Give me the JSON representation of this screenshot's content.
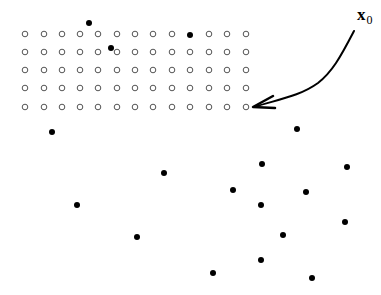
{
  "diagram": {
    "width": 381,
    "height": 295,
    "colors": {
      "background": "#ffffff",
      "ink": "#000000",
      "open_circle_stroke": "#555555"
    },
    "grid": {
      "rows": 5,
      "cols": 13,
      "col_x": [
        25,
        44,
        62,
        80,
        98,
        117,
        135,
        153,
        172,
        190,
        209,
        227,
        246
      ],
      "row_y": [
        34,
        52,
        70,
        88,
        107
      ],
      "open_radius": 2.8,
      "replaced_cells": [
        [
          0,
          9
        ]
      ]
    },
    "filled_points": [
      {
        "x": 89,
        "y": 23
      },
      {
        "x": 111,
        "y": 48
      },
      {
        "x": 190,
        "y": 35
      },
      {
        "x": 52,
        "y": 132
      },
      {
        "x": 297,
        "y": 129
      },
      {
        "x": 164,
        "y": 173
      },
      {
        "x": 262,
        "y": 164
      },
      {
        "x": 347,
        "y": 167
      },
      {
        "x": 233,
        "y": 190
      },
      {
        "x": 306,
        "y": 192
      },
      {
        "x": 77,
        "y": 205
      },
      {
        "x": 261,
        "y": 205
      },
      {
        "x": 345,
        "y": 222
      },
      {
        "x": 137,
        "y": 237
      },
      {
        "x": 283,
        "y": 235
      },
      {
        "x": 261,
        "y": 260
      },
      {
        "x": 213,
        "y": 273
      },
      {
        "x": 312,
        "y": 278
      }
    ],
    "filled_radius": 3,
    "arrow": {
      "path": "M 354 31 C 340 58, 332 72, 318 83 C 300 96, 280 99, 254 107",
      "tip": {
        "x": 253,
        "y": 107
      },
      "barb_upper": {
        "x": 273,
        "y": 96
      },
      "barb_lower": {
        "x": 275,
        "y": 108
      },
      "stroke_width": 2
    },
    "label": {
      "symbol": "x",
      "subscript": "0"
    }
  }
}
